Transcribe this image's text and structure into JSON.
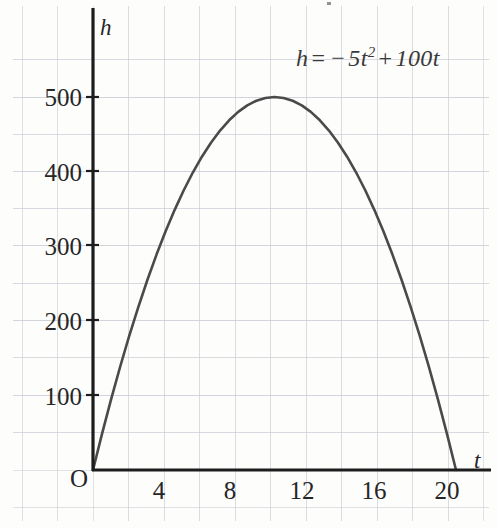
{
  "figure": {
    "background_color": "#fdfdfc",
    "grid_color": "#c9cdd4",
    "axis_color": "#1d1d1d",
    "curve_color": "#4a4a4a"
  },
  "annotation": {
    "equation_label": "h = -5t² + 100t",
    "equation_lhs": "h",
    "equation_eq": "=",
    "equation_minus": "−",
    "equation_coef": "5",
    "equation_var": "t",
    "equation_exp": "2",
    "equation_plus": "+",
    "equation_term2": "100",
    "equation_var2": "t"
  },
  "axes": {
    "x_axis_name": "t",
    "y_axis_name": "h",
    "origin_label": "O",
    "x_ticks": [
      "4",
      "8",
      "12",
      "16",
      "20"
    ],
    "y_ticks": [
      "500",
      "400",
      "300",
      "200",
      "100"
    ]
  },
  "chart_data": {
    "type": "line",
    "title": "",
    "subtitle": "",
    "xlabel": "t",
    "ylabel": "h",
    "annotations": [
      "h = -5t² + 100t"
    ],
    "grid": true,
    "legend": "none",
    "xlim": [
      0,
      21.5
    ],
    "ylim": [
      0,
      560
    ],
    "xticks": [
      4,
      8,
      12,
      16,
      20
    ],
    "yticks": [
      100,
      200,
      300,
      400,
      500
    ],
    "equation": "h = -5*t^2 + 100*t",
    "vertex": {
      "t": 10,
      "h": 500
    },
    "roots": [
      0,
      20
    ],
    "series": [
      {
        "name": "h = -5t^2 + 100t",
        "color": "#4a4a4a",
        "x": [
          0,
          0.5,
          1,
          1.5,
          2,
          2.5,
          3,
          3.5,
          4,
          4.5,
          5,
          5.5,
          6,
          6.5,
          7,
          7.5,
          8,
          8.5,
          9,
          9.5,
          10,
          10.5,
          11,
          11.5,
          12,
          12.5,
          13,
          13.5,
          14,
          14.5,
          15,
          15.5,
          16,
          16.5,
          17,
          17.5,
          18,
          18.5,
          19,
          19.5,
          20
        ],
        "values": [
          0,
          48.75,
          95,
          138.75,
          180,
          218.75,
          255,
          288.75,
          320,
          348.75,
          375,
          398.75,
          420,
          438.75,
          455,
          468.75,
          480,
          488.75,
          495,
          498.75,
          500,
          498.75,
          495,
          488.75,
          480,
          468.75,
          455,
          438.75,
          420,
          398.75,
          375,
          348.75,
          320,
          288.75,
          255,
          218.75,
          180,
          138.75,
          95,
          48.75,
          0
        ]
      }
    ]
  }
}
